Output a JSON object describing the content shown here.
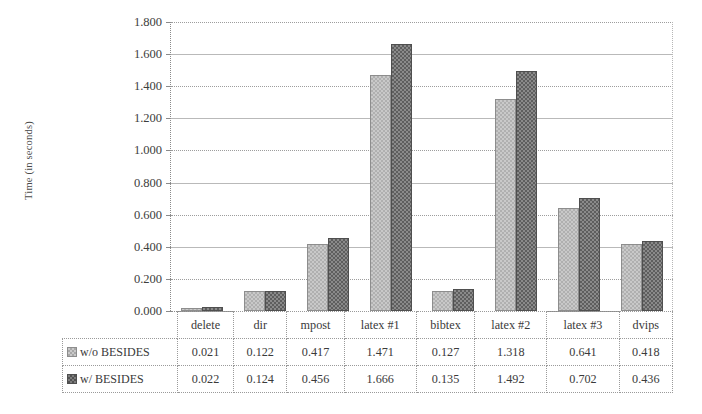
{
  "chart_data": {
    "type": "bar",
    "title": "",
    "xlabel": "",
    "ylabel": "Time (in seconds)",
    "categories": [
      "delete",
      "dir",
      "mpost",
      "latex #1",
      "bibtex",
      "latex #2",
      "latex #3",
      "dvips"
    ],
    "series": [
      {
        "name": "w/o BESIDES",
        "values": [
          0.021,
          0.122,
          0.417,
          1.471,
          0.127,
          1.318,
          0.641,
          0.418
        ],
        "color": "#c9c9c9",
        "pattern": "checkered-light"
      },
      {
        "name": "w/ BESIDES",
        "values": [
          0.022,
          0.124,
          0.456,
          1.666,
          0.135,
          1.492,
          0.702,
          0.436
        ],
        "color": "#7d7d7d",
        "pattern": "checkered-dark"
      }
    ],
    "ylim": [
      0.0,
      1.8
    ],
    "yticks": [
      "0.000",
      "0.200",
      "0.400",
      "0.600",
      "0.800",
      "1.000",
      "1.200",
      "1.400",
      "1.600",
      "1.800"
    ],
    "ytick_values": [
      0.0,
      0.2,
      0.4,
      0.6,
      0.8,
      1.0,
      1.2,
      1.4,
      1.6,
      1.8
    ],
    "grid": true,
    "legend_position": "data-table-left",
    "data_table_visible": true,
    "value_format": "0.000"
  }
}
